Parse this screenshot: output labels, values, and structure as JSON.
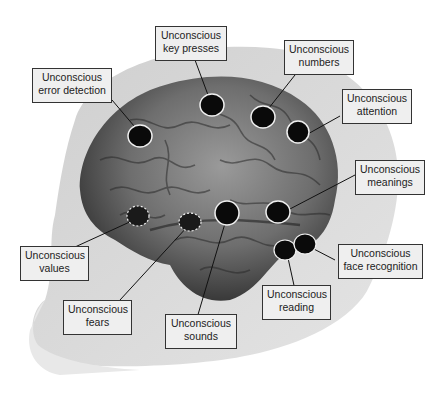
{
  "figure": {
    "colors": {
      "background": "#ffffff",
      "head": "#d2d2d2",
      "brain_dark": "#3a3a3a",
      "brain_mid": "#7a7a7a",
      "marker_fill": "#0a0a0a",
      "label_bg": "#efefef",
      "label_border": "#333333"
    }
  },
  "labels": [
    {
      "id": "error-detection",
      "line1": "Unconscious",
      "line2": "error detection"
    },
    {
      "id": "key-presses",
      "line1": "Unconscious",
      "line2": "key presses"
    },
    {
      "id": "numbers",
      "line1": "Unconscious",
      "line2": "numbers"
    },
    {
      "id": "attention",
      "line1": "Unconscious",
      "line2": "attention"
    },
    {
      "id": "meanings",
      "line1": "Unconscious",
      "line2": "meanings"
    },
    {
      "id": "values",
      "line1": "Unconscious",
      "line2": "values"
    },
    {
      "id": "fears",
      "line1": "Unconscious",
      "line2": "fears"
    },
    {
      "id": "sounds",
      "line1": "Unconscious",
      "line2": "sounds"
    },
    {
      "id": "face-recognition",
      "line1": "Unconscious",
      "line2": "face recognition"
    },
    {
      "id": "reading",
      "line1": "Unconscious",
      "line2": "reading"
    }
  ]
}
